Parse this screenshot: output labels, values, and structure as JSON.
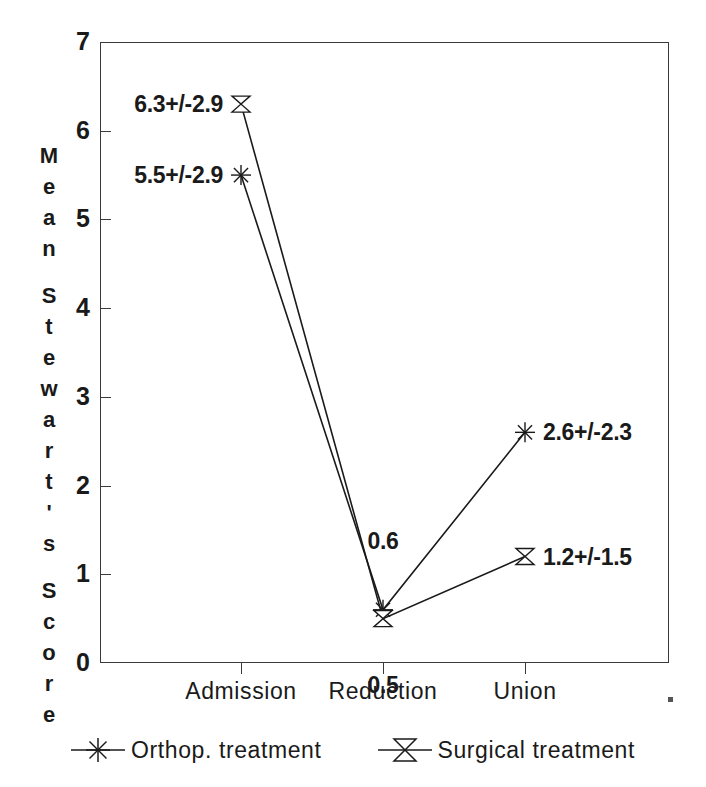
{
  "chart_data": {
    "type": "line",
    "title": "",
    "xlabel": "",
    "ylabel": "Mean Stewart's Score",
    "ylabel_stacked": [
      "M",
      "e",
      "a",
      "n",
      "",
      "S",
      "t",
      "e",
      "w",
      "a",
      "r",
      "t",
      "'",
      "s",
      "",
      "S",
      "c",
      "o",
      "r",
      "e"
    ],
    "categories": [
      "Admission",
      "Reduction",
      "Union"
    ],
    "ylim": [
      0,
      7
    ],
    "yticks": [
      0,
      1,
      2,
      3,
      4,
      5,
      6,
      7
    ],
    "ytick_labels": [
      "0",
      "1",
      "2",
      "3",
      "4",
      "5",
      "6",
      "7"
    ],
    "grid": false,
    "legend_position": "bottom",
    "series": [
      {
        "name": "Orthop. treatment",
        "marker": "asterisk-marker",
        "values": [
          5.5,
          0.6,
          2.6
        ],
        "labels": [
          "5.5+/-2.9",
          "0.6",
          "2.6+/-2.3"
        ],
        "sd": [
          2.9,
          null,
          2.3
        ]
      },
      {
        "name": "Surgical treatment",
        "marker": "bowtie-marker",
        "values": [
          6.3,
          0.5,
          1.2
        ],
        "labels": [
          "6.3+/-2.9",
          "0.5",
          "1.2+/-1.5"
        ],
        "sd": [
          2.9,
          null,
          1.5
        ]
      }
    ],
    "annotations": [
      {
        "text": "6.3+/-2.9",
        "x": "Admission",
        "y": 6.3,
        "align": "right"
      },
      {
        "text": "5.5+/-2.9",
        "x": "Admission",
        "y": 5.5,
        "align": "right"
      },
      {
        "text": "0.6",
        "x": "Reduction",
        "y": 1.38,
        "align": "center"
      },
      {
        "text": "0.5",
        "x": "Reduction",
        "y": -0.25,
        "align": "center"
      },
      {
        "text": "2.6+/-2.3",
        "x": "Union",
        "y": 2.6,
        "align": "left"
      },
      {
        "text": "1.2+/-1.5",
        "x": "Union",
        "y": 1.2,
        "align": "left"
      }
    ],
    "colors": {
      "axis": "#3a3a3a",
      "series_line": "#1a1a1a",
      "text": "#1a1a1a",
      "background": "#ffffff"
    }
  },
  "axis": {
    "y_title": "Mean Stewart's Score",
    "y_tick_labels": [
      "7",
      "6",
      "5",
      "4",
      "3",
      "2",
      "1",
      "0"
    ],
    "x_tick_labels": [
      "Admission",
      "Reduction",
      "Union"
    ]
  },
  "annotations": {
    "a0": "6.3+/-2.9",
    "a1": "5.5+/-2.9",
    "a2": "0.6",
    "a3": "0.5",
    "a4": "2.6+/-2.3",
    "a5": "1.2+/-1.5"
  },
  "legend": {
    "entries": [
      {
        "label": "Orthop. treatment",
        "marker": "asterisk-marker"
      },
      {
        "label": "Surgical treatment",
        "marker": "bowtie-marker"
      }
    ]
  }
}
